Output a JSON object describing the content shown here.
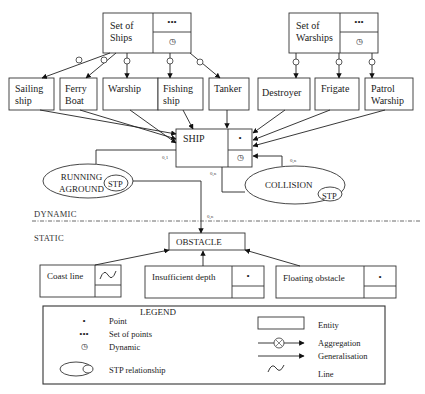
{
  "diagram": {
    "type": "spatio-temporal conceptual data model (ship navigation)",
    "entities": {
      "set_of_ships": {
        "label": "Set of\nShips",
        "spatial": "•••",
        "temporal": "◷"
      },
      "set_of_warships": {
        "label": "Set of\nWarships",
        "spatial": "•••",
        "temporal": "◷"
      },
      "sailing_ship": {
        "label": "Sailing\nship"
      },
      "ferry_boat": {
        "label": "Ferry\nBoat"
      },
      "warship": {
        "label": "Warship"
      },
      "fishing_ship": {
        "label": "Fishing\nship"
      },
      "tanker": {
        "label": "Tanker"
      },
      "destroyer": {
        "label": "Destroyer"
      },
      "frigate": {
        "label": "Frigate"
      },
      "patrol_warship": {
        "label": "Patrol\nWarship"
      },
      "ship": {
        "label": "SHIP",
        "spatial": "•",
        "temporal": "◷"
      },
      "obstacle": {
        "label": "OBSTACLE"
      },
      "coast_line": {
        "label": "Coast line",
        "spatial": "∿"
      },
      "insufficient_depth": {
        "label": "Insufficient depth",
        "spatial": "•"
      },
      "floating_obstacle": {
        "label": "Floating obstacle",
        "spatial": "•"
      }
    },
    "relationships": {
      "running_aground": {
        "label": "RUNNING\nAGROUND",
        "badge": "STP",
        "card_ship": "0,1",
        "card_obstacle": "0,n"
      },
      "collision": {
        "label": "COLLISION",
        "badge": "STP",
        "card_a": "0,n",
        "card_b": "0,n"
      }
    },
    "layers": {
      "dynamic": "DYNAMIC",
      "static": "STATIC"
    },
    "aggregation_symbol": "⊗"
  },
  "legend": {
    "title": "LEGEND",
    "left": [
      {
        "symbol": "•",
        "label": "Point"
      },
      {
        "symbol": "•••",
        "label": "Set of points"
      },
      {
        "symbol": "◷",
        "label": "Dynamic"
      },
      {
        "symbol": "STP-ellipse",
        "label": "STP relationship"
      }
    ],
    "right": [
      {
        "symbol": "rect",
        "label": "Entity"
      },
      {
        "symbol": "aggregation-arrow",
        "label": "Aggregation"
      },
      {
        "symbol": "arrow",
        "label": "Generalisation"
      },
      {
        "symbol": "∿",
        "label": "Line"
      }
    ]
  }
}
